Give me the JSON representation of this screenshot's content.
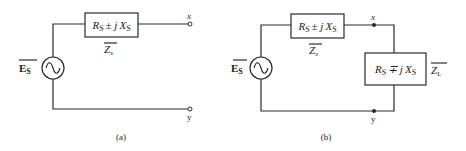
{
  "diagram": {
    "type": "circuit-schematic",
    "panels": [
      {
        "id": "a",
        "caption": "(a)",
        "source": {
          "label_main": "E",
          "label_sub": "S",
          "overbar": true,
          "symbol": "ac-sine-source"
        },
        "series_impedance": {
          "expr_R": "R",
          "expr_R_sub": "S",
          "expr_op": "± j",
          "expr_X": "X",
          "expr_X_sub": "S",
          "name_main": "Z",
          "name_sub": "s",
          "name_overbar": true
        },
        "terminals": [
          {
            "label": "x",
            "style": "open-circle"
          },
          {
            "label": "y",
            "style": "open-circle"
          }
        ]
      },
      {
        "id": "b",
        "caption": "(b)",
        "source": {
          "label_main": "E",
          "label_sub": "S",
          "overbar": true,
          "symbol": "ac-sine-source"
        },
        "series_impedance": {
          "expr_R": "R",
          "expr_R_sub": "S",
          "expr_op": "± j",
          "expr_X": "X",
          "expr_X_sub": "S",
          "name_main": "Z",
          "name_sub": "s",
          "name_overbar": true
        },
        "load_impedance": {
          "expr_R": "R",
          "expr_R_sub": "S",
          "expr_op": "∓ j",
          "expr_X": "X",
          "expr_X_sub": "S",
          "name_main": "Z",
          "name_sub": "L",
          "name_overbar": true
        },
        "terminals": [
          {
            "label": "x",
            "style": "filled-dot"
          },
          {
            "label": "y",
            "style": "filled-dot"
          }
        ]
      }
    ],
    "colors": {
      "line": "#2a2a2a",
      "background": "#ffffff"
    }
  }
}
